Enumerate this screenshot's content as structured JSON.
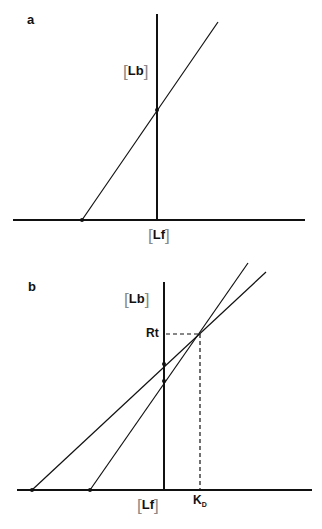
{
  "panels": [
    {
      "id": "a",
      "label": "a",
      "y_axis_label": "Lb",
      "x_axis_label": "Lf",
      "lines": [
        {
          "x_intercept_px": [
            82,
            220
          ],
          "end_px": [
            218,
            22
          ],
          "y_axis_cross_px": [
            157,
            110
          ]
        }
      ]
    },
    {
      "id": "b",
      "label": "b",
      "y_axis_label": "Lb",
      "x_axis_label": "Lf",
      "intersection_y_label": "Rt",
      "intersection_x_label": "K",
      "intersection_x_label_sub": "D",
      "lines": [
        {
          "x_intercept_px": [
            32,
            490
          ],
          "end_px": [
            266,
            272
          ]
        },
        {
          "x_intercept_px": [
            90,
            490
          ],
          "end_px": [
            248,
            263
          ]
        }
      ],
      "intersection_px": [
        199,
        334
      ]
    }
  ],
  "bracket_open": "[",
  "bracket_close": "]"
}
